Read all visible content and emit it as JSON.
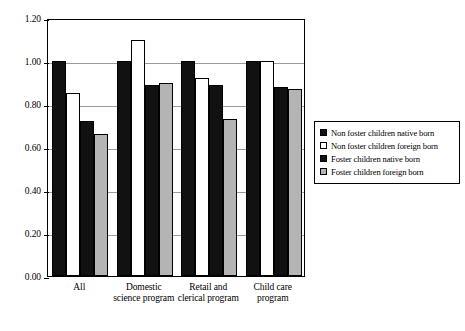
{
  "chart_data": {
    "type": "bar",
    "title": "",
    "subtitle": "",
    "xlabel": "",
    "ylabel": "",
    "ylim": [
      0.0,
      1.2
    ],
    "ytick_labels": [
      "0.00",
      "0.20",
      "0.40",
      "0.60",
      "0.80",
      "1.00",
      "1.20"
    ],
    "ytick_values": [
      0.0,
      0.2,
      0.4,
      0.6,
      0.8,
      1.0,
      1.2
    ],
    "grid": true,
    "legend_position": "right",
    "categories": [
      "All",
      "Domestic science program",
      "Retail and clerical program",
      "Child care program"
    ],
    "series": [
      {
        "name": "Non foster children native born",
        "color": "#111111",
        "values": [
          1.0,
          1.0,
          1.0,
          1.0
        ]
      },
      {
        "name": "Non foster children foreign born",
        "color": "#ffffff",
        "values": [
          0.85,
          1.1,
          0.92,
          1.0
        ]
      },
      {
        "name": "Foster children native born",
        "color": "#111111",
        "values": [
          0.72,
          0.89,
          0.89,
          0.88
        ]
      },
      {
        "name": "Foster children foreign born",
        "color": "#b4b4b4",
        "values": [
          0.66,
          0.9,
          0.73,
          0.87
        ]
      }
    ]
  },
  "legend": {
    "items": [
      "Non foster children native born",
      "Non foster children foreign born",
      "Foster children native born",
      "Foster children foreign born"
    ]
  }
}
